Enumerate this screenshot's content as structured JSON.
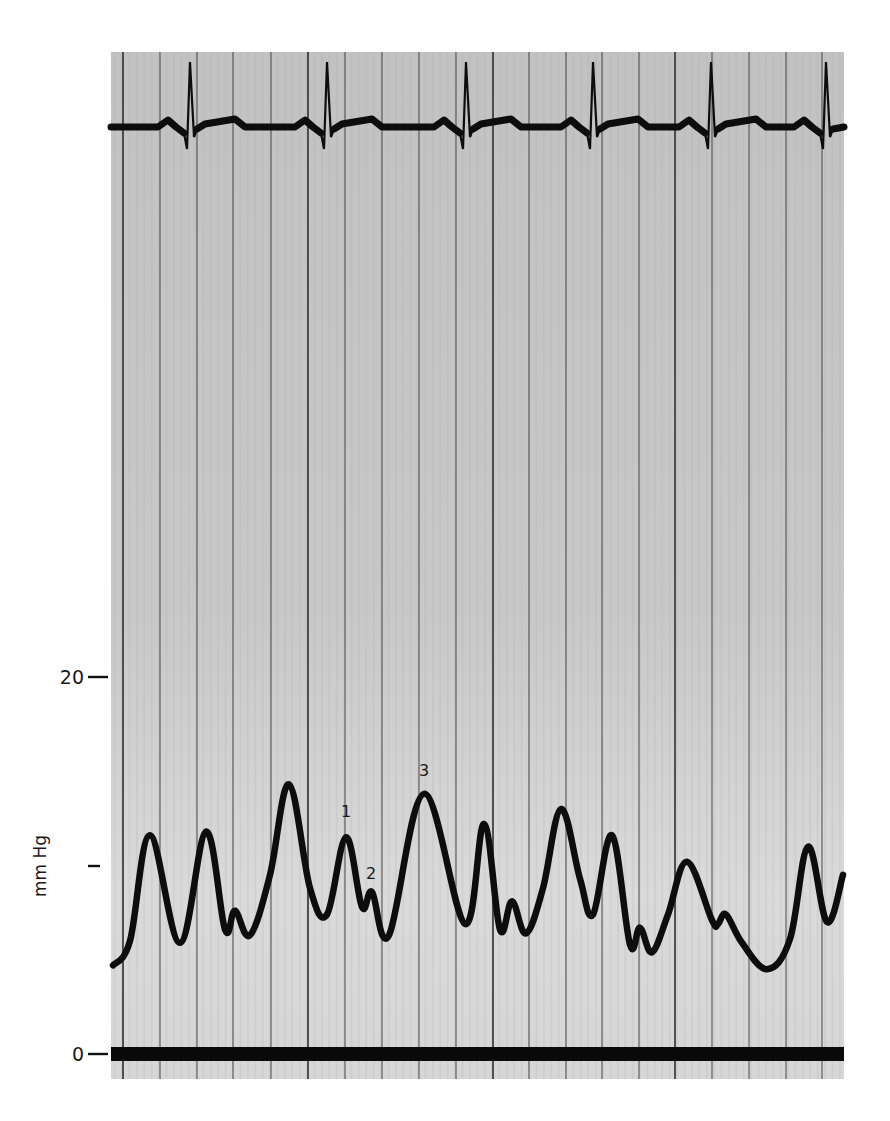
{
  "figure": {
    "paper": {
      "left": 111,
      "top": 52,
      "right": 844,
      "bottom": 1079,
      "color_top": "#c2c2c2",
      "color_bottom": "#d6d6d6",
      "grid_color": "#3a3a3a",
      "trace_color": "#0d0d0d"
    },
    "grid": {
      "vertical_lines_x": [
        123,
        160,
        197,
        233,
        271,
        308,
        345,
        382,
        419,
        456,
        493,
        529,
        566,
        602,
        639,
        675,
        712,
        749,
        786,
        822
      ],
      "major_lines_x": [
        123,
        308,
        493,
        675
      ]
    },
    "y_axis": {
      "label": "mm Hg",
      "ticks": [
        {
          "label": "20",
          "y": 677
        },
        {
          "label": "",
          "y": 866
        },
        {
          "label": "0",
          "y": 1054
        }
      ]
    },
    "annotations": [
      {
        "text": "1",
        "x": 346,
        "y": 811
      },
      {
        "text": "2",
        "x": 371,
        "y": 873
      },
      {
        "text": "3",
        "x": 424,
        "y": 770
      }
    ]
  },
  "chart_data": {
    "type": "line",
    "title": "",
    "xlabel": "",
    "ylabel": "mm Hg",
    "ylim": [
      0,
      20
    ],
    "y_ticks": [
      0,
      10,
      20
    ],
    "y_tick_labels": [
      "0",
      "",
      "20"
    ],
    "grid": "vertical lines only (chart-recorder paper)",
    "legend": null,
    "series": [
      {
        "name": "ECG",
        "description": "Electrocardiogram trace at top of strip; 6 QRS complexes visible",
        "r_wave_x_px": [
          190,
          327,
          466,
          593,
          711,
          826
        ]
      },
      {
        "name": "Pressure (mm Hg)",
        "description": "Pressure waveform with labeled waves 1, 2, 3",
        "points_mmHg": [
          {
            "x_px": 113,
            "y": 4.7
          },
          {
            "x_px": 130,
            "y": 6.0
          },
          {
            "x_px": 150,
            "y": 11.6
          },
          {
            "x_px": 180,
            "y": 5.9
          },
          {
            "x_px": 206,
            "y": 11.8
          },
          {
            "x_px": 225,
            "y": 6.6
          },
          {
            "x_px": 235,
            "y": 7.6
          },
          {
            "x_px": 250,
            "y": 6.3
          },
          {
            "x_px": 270,
            "y": 9.5
          },
          {
            "x_px": 289,
            "y": 14.3
          },
          {
            "x_px": 310,
            "y": 8.8
          },
          {
            "x_px": 327,
            "y": 7.4
          },
          {
            "x_px": 346,
            "y": 11.5
          },
          {
            "x_px": 362,
            "y": 7.8
          },
          {
            "x_px": 372,
            "y": 8.6
          },
          {
            "x_px": 389,
            "y": 6.3
          },
          {
            "x_px": 424,
            "y": 13.8
          },
          {
            "x_px": 465,
            "y": 6.9
          },
          {
            "x_px": 484,
            "y": 12.2
          },
          {
            "x_px": 500,
            "y": 6.6
          },
          {
            "x_px": 512,
            "y": 8.1
          },
          {
            "x_px": 526,
            "y": 6.4
          },
          {
            "x_px": 543,
            "y": 8.8
          },
          {
            "x_px": 561,
            "y": 13.0
          },
          {
            "x_px": 580,
            "y": 9.3
          },
          {
            "x_px": 593,
            "y": 7.4
          },
          {
            "x_px": 612,
            "y": 11.6
          },
          {
            "x_px": 630,
            "y": 5.8
          },
          {
            "x_px": 640,
            "y": 6.7
          },
          {
            "x_px": 652,
            "y": 5.4
          },
          {
            "x_px": 668,
            "y": 7.4
          },
          {
            "x_px": 687,
            "y": 10.2
          },
          {
            "x_px": 712,
            "y": 7.1
          },
          {
            "x_px": 718,
            "y": 6.9
          },
          {
            "x_px": 726,
            "y": 7.4
          },
          {
            "x_px": 742,
            "y": 5.9
          },
          {
            "x_px": 767,
            "y": 4.5
          },
          {
            "x_px": 790,
            "y": 6.1
          },
          {
            "x_px": 808,
            "y": 11.0
          },
          {
            "x_px": 827,
            "y": 7.0
          },
          {
            "x_px": 843,
            "y": 9.5
          }
        ],
        "labeled_peaks": [
          {
            "label": "1",
            "x_px": 346,
            "y": 11.5
          },
          {
            "label": "2",
            "x_px": 372,
            "y": 8.6
          },
          {
            "label": "3",
            "x_px": 424,
            "y": 13.8
          }
        ]
      }
    ]
  }
}
